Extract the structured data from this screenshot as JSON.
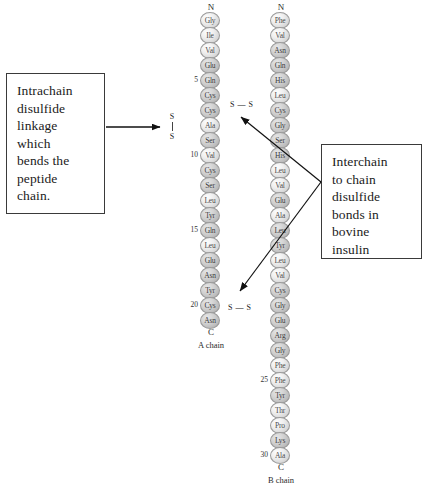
{
  "figure": {
    "callouts": {
      "left": {
        "text": "Intrachain\ndisulfide\nlinkage\nwhich\nbends the\npeptide\nchain."
      },
      "right": {
        "text": "Interchain\nto chain\ndisulfide\nbonds in\nbovine\ninsulin"
      }
    },
    "labels": {
      "n_terminus": "N",
      "c_terminus": "C",
      "disulfide_s": "S",
      "disulfide_horizontal": "S — S"
    },
    "chains": [
      {
        "id": "a-chain",
        "caption": "A chain",
        "n_terminus": "N",
        "c_terminus": "C",
        "residues": [
          {
            "num": "",
            "code": "Gly",
            "shaded": false
          },
          {
            "num": "",
            "code": "Ile",
            "shaded": false
          },
          {
            "num": "",
            "code": "Val",
            "shaded": false
          },
          {
            "num": "",
            "code": "Glu",
            "shaded": true
          },
          {
            "num": "5",
            "code": "Gln",
            "shaded": true
          },
          {
            "num": "",
            "code": "Cys",
            "shaded": true
          },
          {
            "num": "",
            "code": "Cys",
            "shaded": true
          },
          {
            "num": "",
            "code": "Ala",
            "shaded": false
          },
          {
            "num": "",
            "code": "Ser",
            "shaded": true
          },
          {
            "num": "10",
            "code": "Val",
            "shaded": false
          },
          {
            "num": "",
            "code": "Cys",
            "shaded": true
          },
          {
            "num": "",
            "code": "Ser",
            "shaded": true
          },
          {
            "num": "",
            "code": "Leu",
            "shaded": false
          },
          {
            "num": "",
            "code": "Tyr",
            "shaded": true
          },
          {
            "num": "15",
            "code": "Gln",
            "shaded": true
          },
          {
            "num": "",
            "code": "Leu",
            "shaded": false
          },
          {
            "num": "",
            "code": "Glu",
            "shaded": true
          },
          {
            "num": "",
            "code": "Asn",
            "shaded": true
          },
          {
            "num": "",
            "code": "Tyr",
            "shaded": true
          },
          {
            "num": "20",
            "code": "Cys",
            "shaded": true
          },
          {
            "num": "",
            "code": "Asn",
            "shaded": true
          }
        ]
      },
      {
        "id": "b-chain",
        "caption": "B chain",
        "n_terminus": "N",
        "c_terminus": "C",
        "residues": [
          {
            "num": "",
            "code": "Phe",
            "shaded": false
          },
          {
            "num": "",
            "code": "Val",
            "shaded": false
          },
          {
            "num": "",
            "code": "Asn",
            "shaded": true
          },
          {
            "num": "",
            "code": "Gln",
            "shaded": true
          },
          {
            "num": "",
            "code": "His",
            "shaded": true
          },
          {
            "num": "",
            "code": "Leu",
            "shaded": false
          },
          {
            "num": "",
            "code": "Cys",
            "shaded": true
          },
          {
            "num": "",
            "code": "Gly",
            "shaded": true
          },
          {
            "num": "",
            "code": "Ser",
            "shaded": true
          },
          {
            "num": "",
            "code": "His",
            "shaded": true
          },
          {
            "num": "",
            "code": "Leu",
            "shaded": false
          },
          {
            "num": "",
            "code": "Val",
            "shaded": false
          },
          {
            "num": "",
            "code": "Glu",
            "shaded": true
          },
          {
            "num": "",
            "code": "Ala",
            "shaded": false
          },
          {
            "num": "",
            "code": "Leu",
            "shaded": true
          },
          {
            "num": "",
            "code": "Tyr",
            "shaded": true
          },
          {
            "num": "",
            "code": "Leu",
            "shaded": false
          },
          {
            "num": "",
            "code": "Val",
            "shaded": false
          },
          {
            "num": "",
            "code": "Cys",
            "shaded": true
          },
          {
            "num": "",
            "code": "Gly",
            "shaded": true
          },
          {
            "num": "",
            "code": "Glu",
            "shaded": true
          },
          {
            "num": "",
            "code": "Arg",
            "shaded": true
          },
          {
            "num": "",
            "code": "Gly",
            "shaded": true
          },
          {
            "num": "",
            "code": "Phe",
            "shaded": false
          },
          {
            "num": "25",
            "code": "Phe",
            "shaded": false
          },
          {
            "num": "",
            "code": "Tyr",
            "shaded": true
          },
          {
            "num": "",
            "code": "Thr",
            "shaded": false
          },
          {
            "num": "",
            "code": "Pro",
            "shaded": false
          },
          {
            "num": "",
            "code": "Lys",
            "shaded": true
          },
          {
            "num": "30",
            "code": "Ala",
            "shaded": false
          }
        ]
      }
    ],
    "disulfide_bonds": [
      {
        "id": "intrachain-a",
        "style": "vertical",
        "label_top": "S",
        "label_bottom": "S"
      },
      {
        "id": "interchain-upper",
        "style": "horizontal",
        "label": "S — S"
      },
      {
        "id": "interchain-lower",
        "style": "horizontal",
        "label": "S — S"
      }
    ]
  }
}
